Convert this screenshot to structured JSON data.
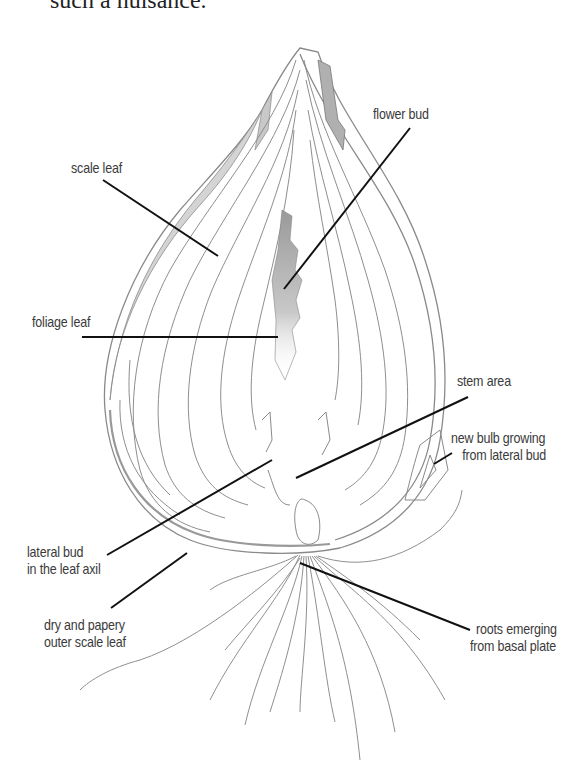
{
  "page": {
    "top_text": "such a nuisance."
  },
  "diagram": {
    "labels": {
      "scale_leaf": "scale leaf",
      "flower_bud": "flower bud",
      "foliage_leaf": "foliage leaf",
      "stem_area": "stem area",
      "new_bulb": [
        "new bulb growing",
        "from lateral bud"
      ],
      "lateral_bud": [
        "lateral bud",
        "in the leaf axil"
      ],
      "dry_papery": [
        "dry and papery",
        "outer scale leaf"
      ],
      "roots": [
        "roots emerging",
        "from basal plate"
      ]
    },
    "colors": {
      "outline": "#8a8a8a",
      "shade": "#b5b5b5",
      "leader_line": "#111111",
      "label_text": "#3a3a3a"
    }
  }
}
